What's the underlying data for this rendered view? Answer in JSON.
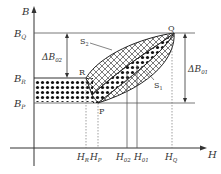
{
  "diagram": {
    "axes": {
      "y_label": "B",
      "x_label": "H"
    },
    "y_levels": [
      {
        "id": "BQ",
        "label": "B",
        "sub": "Q"
      },
      {
        "id": "BR",
        "label": "B",
        "sub": "R"
      },
      {
        "id": "BP",
        "label": "B",
        "sub": "P"
      }
    ],
    "x_ticks": [
      {
        "id": "HR",
        "label": "H",
        "sub": "R"
      },
      {
        "id": "HP",
        "label": "H",
        "sub": "P"
      },
      {
        "id": "H02",
        "label": "H",
        "sub": "02"
      },
      {
        "id": "H01",
        "label": "H",
        "sub": "01"
      },
      {
        "id": "HQ",
        "label": "H",
        "sub": "Q"
      }
    ],
    "points": {
      "R": "R",
      "P": "P",
      "Q": "Q"
    },
    "regions": {
      "S1": {
        "label": "S",
        "sub": "1"
      },
      "S2": {
        "label": "S",
        "sub": "2"
      }
    },
    "deltas": {
      "dB02": {
        "label": "ΔB",
        "sub": "02"
      },
      "dB01": {
        "label": "ΔB",
        "sub": "01"
      }
    },
    "colors": {
      "line": "#333333",
      "fill_dots": "#111111"
    }
  }
}
